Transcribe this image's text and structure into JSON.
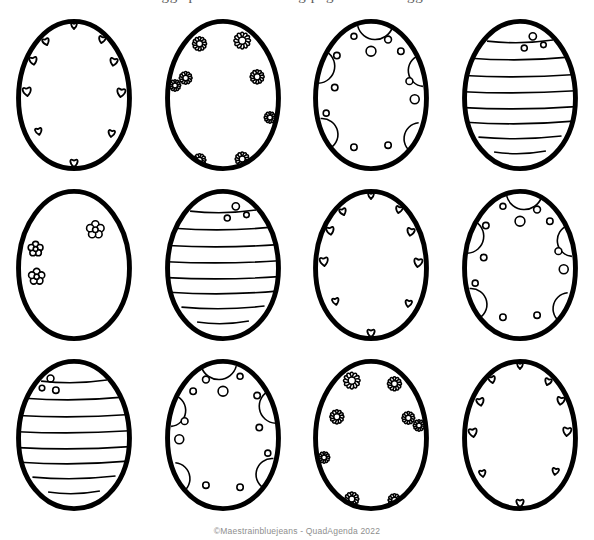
{
  "page": {
    "title": "Easter eggs printable coloring page with 12 eggs to color",
    "background_color": "#ffffff",
    "line_color": "#000000",
    "footer_text": "©Maestrainbluejeans - QuadAgenda 2022"
  },
  "grid": {
    "columns": 4,
    "rows": 3,
    "count": 12
  },
  "patterns": {
    "hearts": "hearts",
    "daisies": "daisies",
    "circles": "circles",
    "stripes": "stripes",
    "flowers": "round-flowers"
  },
  "eggs": [
    {
      "index": 1,
      "row": 1,
      "col": 1,
      "pattern": "hearts",
      "label": "Egg 1 hearts pattern"
    },
    {
      "index": 2,
      "row": 1,
      "col": 2,
      "pattern": "daisies",
      "label": "Egg 2 daisy flowers pattern"
    },
    {
      "index": 3,
      "row": 1,
      "col": 3,
      "pattern": "circles",
      "label": "Egg 3 circles and bubbles pattern"
    },
    {
      "index": 4,
      "row": 1,
      "col": 4,
      "pattern": "stripes",
      "label": "Egg 4 horizontal stripes pattern"
    },
    {
      "index": 5,
      "row": 2,
      "col": 1,
      "pattern": "round-flowers",
      "label": "Egg 5 round five petal flowers pattern"
    },
    {
      "index": 6,
      "row": 2,
      "col": 2,
      "pattern": "stripes",
      "label": "Egg 6 horizontal stripes pattern"
    },
    {
      "index": 7,
      "row": 2,
      "col": 3,
      "pattern": "hearts",
      "label": "Egg 7 hearts pattern"
    },
    {
      "index": 8,
      "row": 2,
      "col": 4,
      "pattern": "circles",
      "label": "Egg 8 circles and bubbles pattern"
    },
    {
      "index": 9,
      "row": 3,
      "col": 1,
      "pattern": "stripes",
      "label": "Egg 9 horizontal stripes pattern"
    },
    {
      "index": 10,
      "row": 3,
      "col": 2,
      "pattern": "circles",
      "label": "Egg 10 circles and bubbles pattern"
    },
    {
      "index": 11,
      "row": 3,
      "col": 3,
      "pattern": "daisies",
      "label": "Egg 11 daisy flowers pattern"
    },
    {
      "index": 12,
      "row": 3,
      "col": 4,
      "pattern": "hearts",
      "label": "Egg 12 hearts pattern"
    }
  ]
}
